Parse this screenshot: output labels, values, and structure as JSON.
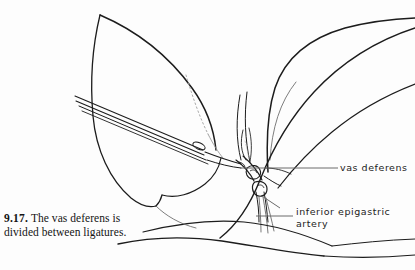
{
  "figure": {
    "number": "9.17.",
    "caption": "The vas deferens is divided between ligatures.",
    "background_color": "#fdfdfd",
    "ink_color": "#1c1c1c",
    "light_ink_color": "#7a7a7a",
    "width": 415,
    "height": 270
  },
  "labels": [
    {
      "id": "vas-deferens",
      "text": "vas deferens",
      "leader_from_x": 240,
      "leader_from_y": 168,
      "leader_to_x": 338,
      "leader_to_y": 168
    },
    {
      "id": "inferior-epigastric-artery",
      "line1": "inferior epigastric",
      "line2": "artery",
      "leader_from_x": 262,
      "leader_from_y": 196,
      "leader_to_x": 293,
      "leader_to_y": 216
    }
  ],
  "drawing": {
    "type": "anatomical-line-illustration",
    "subject": "surgical division of the vas deferens between ligatures",
    "elements": [
      "peritoneal-tissue-flap",
      "surgical-forceps",
      "vas-deferens",
      "ligature-knot-proximal",
      "ligature-knot-distal",
      "suture-thread-tails",
      "inferior-epigastric-vessels",
      "inguinal-fascial-band",
      "lower-tissue-plane"
    ]
  }
}
